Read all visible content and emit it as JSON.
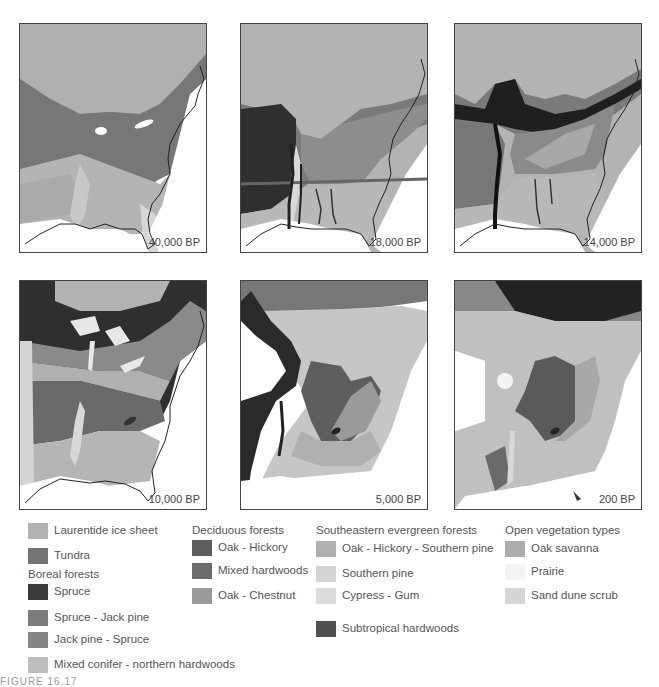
{
  "panels": [
    {
      "label": "40,000 BP"
    },
    {
      "label": "18,000 BP"
    },
    {
      "label": "14,000 BP"
    },
    {
      "label": "10,000 BP"
    },
    {
      "label": "5,000 BP"
    },
    {
      "label": "200 BP"
    }
  ],
  "legend": {
    "col1": {
      "items_top": [
        {
          "label": "Laurentide ice sheet",
          "color": "#b3b3b3"
        },
        {
          "label": "Tundra",
          "color": "#757575"
        }
      ],
      "group_title": "Boreal forests",
      "items": [
        {
          "label": "Spruce",
          "color": "#3a3a3a"
        },
        {
          "label": "Spruce - Jack pine",
          "color": "#7c7c7c"
        },
        {
          "label": "Jack pine - Spruce",
          "color": "#858585"
        },
        {
          "label": "Mixed conifer - northern hardwoods",
          "color": "#bdbdbd"
        }
      ]
    },
    "col2": {
      "group_title": "Deciduous forests",
      "items": [
        {
          "label": "Oak - Hickory",
          "color": "#5e5e5e"
        },
        {
          "label": "Mixed hardwoods",
          "color": "#6d6d6d"
        },
        {
          "label": "Oak - Chestnut",
          "color": "#999999"
        }
      ]
    },
    "col3": {
      "group_title": "Southeastern evergreen forests",
      "items": [
        {
          "label": "Oak - Hickory - Southern pine",
          "color": "#b0b0b0"
        },
        {
          "label": "Southern pine",
          "color": "#d4d4d4"
        },
        {
          "label": "Cypress - Gum",
          "color": "#dcdcdc"
        },
        {
          "label": "Subtropical hardwoods",
          "color": "#505050"
        }
      ]
    },
    "col4": {
      "group_title": "Open vegetation types",
      "items": [
        {
          "label": "Oak savanna",
          "color": "#adadad"
        },
        {
          "label": "Prairie",
          "color": "#f4f4f4"
        },
        {
          "label": "Sand dune scrub",
          "color": "#d6d6d6"
        }
      ]
    }
  },
  "caption": "FIGURE 16.17"
}
